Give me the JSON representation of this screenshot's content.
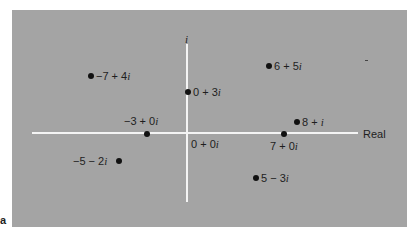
{
  "figure": {
    "x_axis_label": "Real",
    "y_axis_label": "i",
    "origin_label": "0 + 0i",
    "corner_mark": "a",
    "background_color": "#a4a4a4",
    "axis_color": "#f4f4f4",
    "point_color": "#111111"
  },
  "points": [
    {
      "label": "−7 + 4",
      "suffix": "i",
      "re": -7,
      "im": 4
    },
    {
      "label": "0 + 3",
      "suffix": "i",
      "re": 0,
      "im": 3
    },
    {
      "label": "6 + 5",
      "suffix": "i",
      "re": 6,
      "im": 5
    },
    {
      "label": "−3 + 0",
      "suffix": "i",
      "re": -3,
      "im": 0
    },
    {
      "label": "8 + ",
      "suffix": "i",
      "re": 8,
      "im": 1
    },
    {
      "label": "7 + 0",
      "suffix": "i",
      "re": 7,
      "im": 0
    },
    {
      "label": "−5 − 2",
      "suffix": "i",
      "re": -5,
      "im": -2
    },
    {
      "label": "5 − 3",
      "suffix": "i",
      "re": 5,
      "im": -3
    }
  ],
  "origin": {
    "label": "0 + 0",
    "suffix": "i"
  }
}
